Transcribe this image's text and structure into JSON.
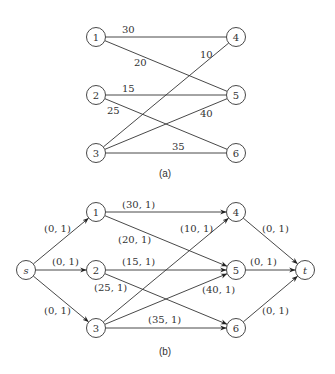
{
  "diagram_a": {
    "caption": "(a)",
    "nodes": [
      {
        "id": "1",
        "label": "1",
        "x": 96,
        "y": 37
      },
      {
        "id": "2",
        "label": "2",
        "x": 96,
        "y": 95
      },
      {
        "id": "3",
        "label": "3",
        "x": 96,
        "y": 153
      },
      {
        "id": "4",
        "label": "4",
        "x": 236,
        "y": 37
      },
      {
        "id": "5",
        "label": "5",
        "x": 236,
        "y": 95
      },
      {
        "id": "6",
        "label": "6",
        "x": 236,
        "y": 153
      }
    ],
    "edges": [
      {
        "from": "1",
        "to": "4",
        "label": "30",
        "lx": 122,
        "ly": 33
      },
      {
        "from": "1",
        "to": "5",
        "label": "20",
        "lx": 134,
        "ly": 66
      },
      {
        "from": "2",
        "to": "5",
        "label": "15",
        "lx": 122,
        "ly": 92
      },
      {
        "from": "2",
        "to": "6",
        "label": "25",
        "lx": 107,
        "ly": 114
      },
      {
        "from": "3",
        "to": "4",
        "label": "10",
        "lx": 200,
        "ly": 58
      },
      {
        "from": "3",
        "to": "5",
        "label": "40",
        "lx": 200,
        "ly": 117
      },
      {
        "from": "3",
        "to": "6",
        "label": "35",
        "lx": 172,
        "ly": 150
      }
    ]
  },
  "diagram_b": {
    "caption": "(b)",
    "nodes": [
      {
        "id": "s",
        "label": "s",
        "x": 26,
        "y": 270,
        "italic": true
      },
      {
        "id": "1",
        "label": "1",
        "x": 96,
        "y": 212
      },
      {
        "id": "2",
        "label": "2",
        "x": 96,
        "y": 270
      },
      {
        "id": "3",
        "label": "3",
        "x": 96,
        "y": 328
      },
      {
        "id": "4",
        "label": "4",
        "x": 236,
        "y": 212
      },
      {
        "id": "5",
        "label": "5",
        "x": 236,
        "y": 270
      },
      {
        "id": "6",
        "label": "6",
        "x": 236,
        "y": 328
      },
      {
        "id": "t",
        "label": "t",
        "x": 305,
        "y": 270,
        "italic": true
      }
    ],
    "edges": [
      {
        "from": "s",
        "to": "1",
        "label": "(0, 1)",
        "lx": 44,
        "ly": 232
      },
      {
        "from": "s",
        "to": "2",
        "label": "(0, 1)",
        "lx": 52,
        "ly": 265
      },
      {
        "from": "s",
        "to": "3",
        "label": "(0, 1)",
        "lx": 44,
        "ly": 314
      },
      {
        "from": "1",
        "to": "4",
        "label": "(30, 1)",
        "lx": 122,
        "ly": 208
      },
      {
        "from": "1",
        "to": "5",
        "label": "(20, 1)",
        "lx": 118,
        "ly": 243
      },
      {
        "from": "2",
        "to": "5",
        "label": "(15, 1)",
        "lx": 122,
        "ly": 265
      },
      {
        "from": "2",
        "to": "6",
        "label": "(25, 1)",
        "lx": 94,
        "ly": 291
      },
      {
        "from": "3",
        "to": "4",
        "label": "(10, 1)",
        "lx": 180,
        "ly": 232
      },
      {
        "from": "3",
        "to": "5",
        "label": "(40, 1)",
        "lx": 202,
        "ly": 293
      },
      {
        "from": "3",
        "to": "6",
        "label": "(35, 1)",
        "lx": 148,
        "ly": 323
      },
      {
        "from": "4",
        "to": "t",
        "label": "(0, 1)",
        "lx": 262,
        "ly": 232
      },
      {
        "from": "5",
        "to": "t",
        "label": "(0, 1)",
        "lx": 250,
        "ly": 265
      },
      {
        "from": "6",
        "to": "t",
        "label": "(0, 1)",
        "lx": 262,
        "ly": 314
      }
    ]
  }
}
